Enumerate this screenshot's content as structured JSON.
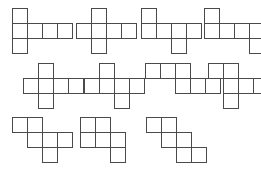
{
  "figure": {
    "background_color": "#ffffff",
    "stroke_color": "#4a4a4a",
    "cell_size": 15,
    "canvas": {
      "width": 261,
      "height": 169
    },
    "rows": 3,
    "shape_count": 11,
    "shapes": [
      {
        "name": "net-1",
        "label": "T-shape net",
        "origin_x": 12,
        "origin_y": 8,
        "cells": [
          [
            0,
            0
          ],
          [
            0,
            1
          ],
          [
            1,
            1
          ],
          [
            2,
            1
          ],
          [
            3,
            1
          ],
          [
            0,
            2
          ]
        ]
      },
      {
        "name": "net-2",
        "label": "Z-offset net",
        "origin_x": 76,
        "origin_y": 8,
        "cells": [
          [
            1,
            0
          ],
          [
            0,
            1
          ],
          [
            1,
            1
          ],
          [
            2,
            1
          ],
          [
            3,
            1
          ],
          [
            1,
            2
          ]
        ]
      },
      {
        "name": "net-3",
        "label": "Step net",
        "origin_x": 141,
        "origin_y": 8,
        "cells": [
          [
            0,
            0
          ],
          [
            0,
            1
          ],
          [
            1,
            1
          ],
          [
            2,
            1
          ],
          [
            3,
            1
          ],
          [
            2,
            2
          ]
        ]
      },
      {
        "name": "net-4",
        "label": "L-tail net",
        "origin_x": 204,
        "origin_y": 8,
        "cells": [
          [
            0,
            0
          ],
          [
            0,
            1
          ],
          [
            1,
            1
          ],
          [
            2,
            1
          ],
          [
            3,
            1
          ],
          [
            3,
            2
          ]
        ]
      },
      {
        "name": "net-5",
        "label": "Cross net",
        "origin_x": 23,
        "origin_y": 63,
        "cells": [
          [
            1,
            0
          ],
          [
            0,
            1
          ],
          [
            1,
            1
          ],
          [
            2,
            1
          ],
          [
            3,
            1
          ],
          [
            1,
            2
          ]
        ]
      },
      {
        "name": "net-6",
        "label": "Cross offset net",
        "origin_x": 84,
        "origin_y": 63,
        "cells": [
          [
            1,
            0
          ],
          [
            0,
            1
          ],
          [
            1,
            1
          ],
          [
            2,
            1
          ],
          [
            3,
            1
          ],
          [
            2,
            2
          ]
        ]
      },
      {
        "name": "net-7",
        "label": "Stair net",
        "origin_x": 145,
        "origin_y": 63,
        "cells": [
          [
            0,
            0
          ],
          [
            1,
            0
          ],
          [
            2,
            0
          ],
          [
            2,
            1
          ],
          [
            3,
            1
          ],
          [
            4,
            1
          ]
        ]
      },
      {
        "name": "net-8",
        "label": "Corner cross net",
        "origin_x": 208,
        "origin_y": 63,
        "cells": [
          [
            0,
            0
          ],
          [
            1,
            0
          ],
          [
            1,
            1
          ],
          [
            2,
            1
          ],
          [
            3,
            1
          ],
          [
            1,
            2
          ]
        ]
      },
      {
        "name": "net-9",
        "label": "Zigzag net",
        "origin_x": 12,
        "origin_y": 117,
        "cells": [
          [
            0,
            0
          ],
          [
            1,
            0
          ],
          [
            1,
            1
          ],
          [
            2,
            1
          ],
          [
            3,
            1
          ],
          [
            2,
            2
          ]
        ]
      },
      {
        "name": "net-10",
        "label": "Zigzag tail net",
        "origin_x": 80,
        "origin_y": 117,
        "cells": [
          [
            0,
            0
          ],
          [
            1,
            0
          ],
          [
            0,
            1
          ],
          [
            1,
            1
          ],
          [
            2,
            1
          ],
          [
            2,
            2
          ]
        ]
      },
      {
        "name": "net-11",
        "label": "Diagonal stair net",
        "origin_x": 146,
        "origin_y": 117,
        "cells": [
          [
            0,
            0
          ],
          [
            1,
            0
          ],
          [
            1,
            1
          ],
          [
            2,
            1
          ],
          [
            2,
            2
          ],
          [
            3,
            2
          ]
        ]
      }
    ]
  }
}
